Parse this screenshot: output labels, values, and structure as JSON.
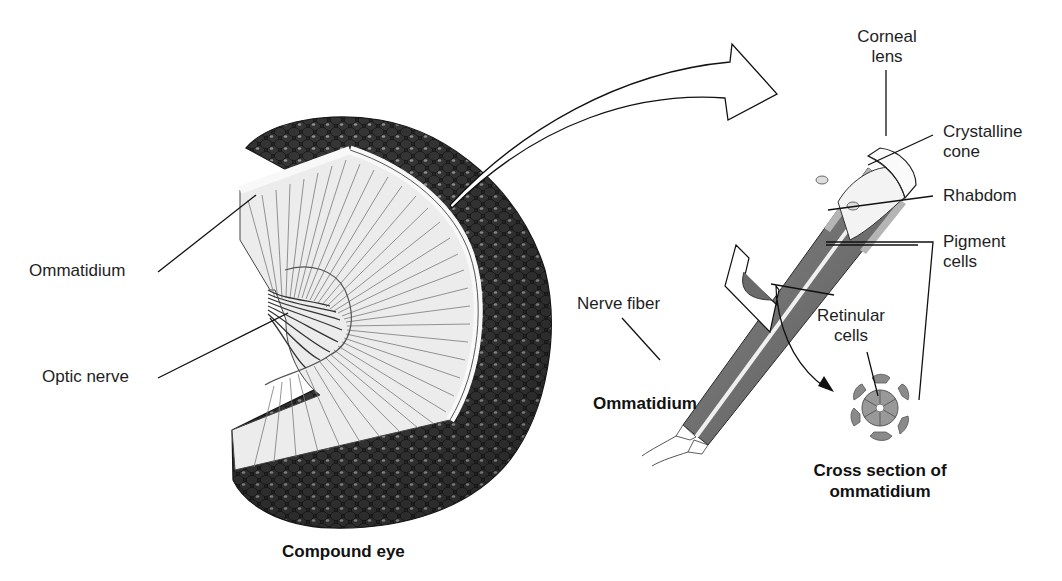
{
  "figure": {
    "compound_eye": {
      "caption": "Compound eye",
      "labels": {
        "ommatidium": "Ommatidium",
        "optic_nerve": "Optic nerve"
      }
    },
    "ommatidium": {
      "caption": "Ommatidium",
      "labels": {
        "corneal_lens_line1": "Corneal",
        "corneal_lens_line2": "lens",
        "crystalline_cone_line1": "Crystalline",
        "crystalline_cone_line2": "cone",
        "rhabdom": "Rhabdom",
        "pigment_cells_line1": "Pigment",
        "pigment_cells_line2": "cells",
        "retinular_cells_line1": "Retinular",
        "retinular_cells_line2": "cells",
        "nerve_fiber": "Nerve fiber"
      }
    },
    "cross_section": {
      "caption_line1": "Cross section of",
      "caption_line2": "ommatidium"
    },
    "colors": {
      "facet_dark": "#2e2e2e",
      "facet_highlight": "#9a9a9a",
      "interior_light": "#ececec",
      "interior_lines": "#7a7a7a",
      "tube_gray": "#6e6e6e",
      "pigment_gray": "#8a8a8a",
      "line": "#111111"
    }
  }
}
